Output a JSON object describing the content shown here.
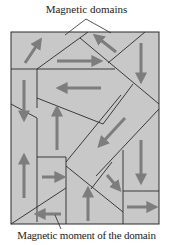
{
  "title": "Magnetic domains",
  "labels": {
    "top": "Magnetic domains",
    "bottom": "Magnetic moment of the domain"
  },
  "colors": {
    "background": "#ffffff",
    "domain_fill": "#c8c8c8",
    "domain_border": "#2a2a2a",
    "arrow": "#7d7d7d",
    "text": "#222222"
  },
  "domains": [
    {
      "id": "d1",
      "arrow_direction": "up-right"
    },
    {
      "id": "d2",
      "arrow_direction": "up-left"
    },
    {
      "id": "d3",
      "arrow_direction": "right"
    },
    {
      "id": "d4",
      "arrow_direction": "down"
    },
    {
      "id": "d5",
      "arrow_direction": "down"
    },
    {
      "id": "d6",
      "arrow_direction": "left"
    },
    {
      "id": "d7",
      "arrow_direction": "up"
    },
    {
      "id": "d8",
      "arrow_direction": "down-left"
    },
    {
      "id": "d9",
      "arrow_direction": "up"
    },
    {
      "id": "d10",
      "arrow_direction": "right"
    },
    {
      "id": "d11",
      "arrow_direction": "left"
    },
    {
      "id": "d12",
      "arrow_direction": "down-right"
    },
    {
      "id": "d13",
      "arrow_direction": "up"
    },
    {
      "id": "d14",
      "arrow_direction": "down"
    },
    {
      "id": "d15",
      "arrow_direction": "right"
    }
  ]
}
